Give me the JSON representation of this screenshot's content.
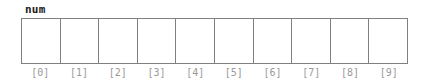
{
  "figure": {
    "kind": "array-diagram",
    "variable_label": "num",
    "colors": {
      "background": "#ffffff",
      "cell_fill": "#ffffff",
      "cell_border": "#808080",
      "label_text": "#1a1a1a",
      "index_text": "#9a9a9a"
    },
    "cells": [
      {
        "index_label": "[0]",
        "value": ""
      },
      {
        "index_label": "[1]",
        "value": ""
      },
      {
        "index_label": "[2]",
        "value": ""
      },
      {
        "index_label": "[3]",
        "value": ""
      },
      {
        "index_label": "[4]",
        "value": ""
      },
      {
        "index_label": "[5]",
        "value": ""
      },
      {
        "index_label": "[6]",
        "value": ""
      },
      {
        "index_label": "[7]",
        "value": ""
      },
      {
        "index_label": "[8]",
        "value": ""
      },
      {
        "index_label": "[9]",
        "value": ""
      }
    ]
  }
}
